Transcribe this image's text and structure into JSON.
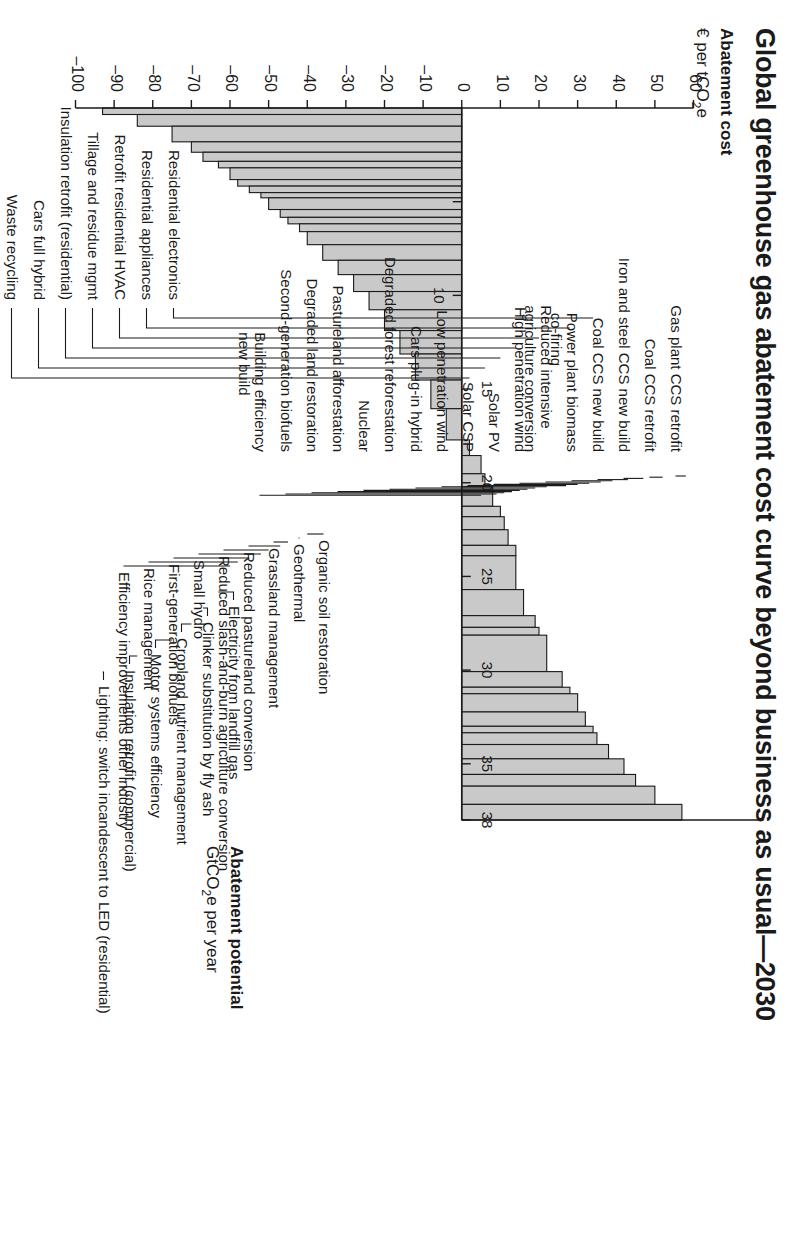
{
  "title": "Global greenhouse gas abatement cost curve beyond business as usual—2030",
  "cost_axis": {
    "label_bold": "Abatement cost",
    "label_unit": "€ per tCO₂e",
    "ticks": [
      60,
      50,
      40,
      30,
      20,
      10,
      0,
      -10,
      -20,
      -30,
      -40,
      -50,
      -60,
      -70,
      -80,
      -90,
      -100
    ]
  },
  "potential_axis": {
    "label_bold": "Abatement potential",
    "label_unit": "GtCO₂e per year",
    "ticks": [
      5,
      10,
      15,
      20,
      25,
      30,
      35,
      38
    ],
    "shown_ticks": [
      10,
      15,
      20,
      25,
      30,
      35,
      38
    ]
  },
  "callouts_positive": [
    "Residential electronics",
    "Residential appliances",
    "Retrofit residential HVAC",
    "Tillage and residue mgmt",
    "Insulation retrofit (residential)",
    "Cars full hybrid",
    "Waste recycling"
  ],
  "callouts_negative": [
    "Electricity from landfill gas",
    "Clinker substitution by fly ash",
    "Cropland nutrient management",
    "Motor systems efficiency",
    "Insulation retrofit (commercial)",
    "Lighting: switch incandescent to LED (residential)"
  ],
  "callouts_upper_left": [
    "Gas plant CCS retrofit",
    "Coal CCS retrofit",
    "Iron and steel CCS new build",
    "Coal CCS new build",
    "Power plant biomass\nco-firing",
    "Reduced intensive\nagriculture conversion",
    "High penetration wind",
    "Solar PV",
    "Solar CSP",
    "Low penetration wind",
    "Cars plug-in hybrid",
    "Degraded forest reforestation",
    "Nuclear",
    "Pastureland afforestation",
    "Degraded land restoration",
    "Second-generation biofuels",
    "Building efficiency\nnew build"
  ],
  "callouts_mid_right": [
    "Organic soil restoration",
    "Geothermal",
    "Grassland management",
    "Reduced pastureland conversion",
    "Reduced slash-and-burn agriculture conversion",
    "Small hydro",
    "First-generation biofuels",
    "Rice management",
    "Efficiency improvements other industry"
  ],
  "colors": {
    "bar_fill": "#c9c9c9",
    "bar_stroke": "#1a1a1a",
    "axis": "#1a1a1a",
    "background": "#ffffff"
  },
  "chart_data": {
    "type": "bar",
    "title": "Global greenhouse gas abatement cost curve beyond business as usual—2030",
    "xlabel": "Abatement potential GtCO2e per year",
    "ylabel": "Abatement cost € per tCO2e",
    "xlim": [
      0,
      38
    ],
    "ylim": [
      -100,
      60
    ],
    "grid": false,
    "legend": null,
    "note": "Marginal abatement cost curve: each bar's WIDTH is abatement potential (GtCO2e/yr) and its HEIGHT is abatement cost (€/tCO2e). Bars are sorted left-to-right from most negative (cheapest) cost to highest cost.",
    "bars": [
      {
        "label": "Lighting: switch incandescent to LED (residential)",
        "width": 0.25,
        "cost": -93
      },
      {
        "label": "Insulation retrofit (commercial)",
        "width": 0.45,
        "cost": -84
      },
      {
        "label": "Motor systems efficiency",
        "width": 0.6,
        "cost": -75
      },
      {
        "label": "Cropland nutrient management",
        "width": 0.4,
        "cost": -70
      },
      {
        "label": "Clinker substitution by fly ash",
        "width": 0.35,
        "cost": -67
      },
      {
        "label": "Electricity from landfill gas",
        "width": 0.25,
        "cost": -63
      },
      {
        "label": "Efficiency improvements other industry",
        "width": 0.45,
        "cost": -60
      },
      {
        "label": "Rice management",
        "width": 0.25,
        "cost": -58
      },
      {
        "label": "First-generation biofuels",
        "width": 0.25,
        "cost": -55
      },
      {
        "label": "Small hydro",
        "width": 0.2,
        "cost": -52
      },
      {
        "label": "Reduced slash-and-burn agriculture conversion",
        "width": 0.45,
        "cost": -50
      },
      {
        "label": "Reduced pastureland conversion",
        "width": 0.3,
        "cost": -47
      },
      {
        "label": "Grassland management",
        "width": 0.25,
        "cost": -45
      },
      {
        "label": "Geothermal",
        "width": 0.3,
        "cost": -42
      },
      {
        "label": "Organic soil restoration",
        "width": 0.5,
        "cost": -40
      },
      {
        "label": "Unlabelled bundle A",
        "width": 0.6,
        "cost": -36
      },
      {
        "label": "Unlabelled bundle B",
        "width": 0.55,
        "cost": -32
      },
      {
        "label": "Unlabelled bundle C",
        "width": 0.65,
        "cost": -28
      },
      {
        "label": "Unlabelled bundle D",
        "width": 0.7,
        "cost": -24
      },
      {
        "label": "Unlabelled bundle E",
        "width": 0.8,
        "cost": -20
      },
      {
        "label": "Unlabelled bundle F",
        "width": 0.9,
        "cost": -16
      },
      {
        "label": "Unlabelled bundle G",
        "width": 1.0,
        "cost": -12
      },
      {
        "label": "Unlabelled bundle H",
        "width": 1.1,
        "cost": -8
      },
      {
        "label": "Unlabelled bundle I",
        "width": 1.2,
        "cost": -4
      },
      {
        "label": "Waste recycling",
        "width": 0.6,
        "cost": 2
      },
      {
        "label": "Cars full hybrid",
        "width": 0.5,
        "cost": 6
      },
      {
        "label": "Insulation retrofit (residential)",
        "width": 0.4,
        "cost": 10
      },
      {
        "label": "Tillage and residue mgmt",
        "width": 0.4,
        "cost": 14
      },
      {
        "label": "Retrofit residential HVAC",
        "width": 0.3,
        "cost": 20
      },
      {
        "label": "Residential appliances",
        "width": 0.25,
        "cost": 28
      },
      {
        "label": "Residential electronics",
        "width": 0.25,
        "cost": 34
      },
      {
        "label": "Building efficiency new build",
        "width": 0.7,
        "cost": 5
      },
      {
        "label": "Second-generation biofuels",
        "width": 0.75,
        "cost": 8
      },
      {
        "label": "Degraded land restoration",
        "width": 0.5,
        "cost": 11
      },
      {
        "label": "Pastureland afforestation",
        "width": 0.6,
        "cost": 12
      },
      {
        "label": "Nuclear",
        "width": 1.3,
        "cost": 14
      },
      {
        "label": "Degraded forest reforestation",
        "width": 1.0,
        "cost": 16
      },
      {
        "label": "Cars plug-in hybrid",
        "width": 0.45,
        "cost": 19
      },
      {
        "label": "Low penetration wind",
        "width": 1.4,
        "cost": 22
      },
      {
        "label": "Solar CSP",
        "width": 0.6,
        "cost": 26
      },
      {
        "label": "Solar PV",
        "width": 0.7,
        "cost": 30
      },
      {
        "label": "High penetration wind",
        "width": 0.55,
        "cost": 32
      },
      {
        "label": "Reduced intensive agriculture conversion",
        "width": 0.45,
        "cost": 35
      },
      {
        "label": "Power plant biomass co-firing",
        "width": 0.55,
        "cost": 38
      },
      {
        "label": "Coal CCS new build",
        "width": 0.6,
        "cost": 42
      },
      {
        "label": "Iron and steel CCS new build",
        "width": 0.45,
        "cost": 45
      },
      {
        "label": "Coal CCS retrofit",
        "width": 0.7,
        "cost": 50
      },
      {
        "label": "Gas plant CCS retrofit",
        "width": 0.6,
        "cost": 57
      }
    ]
  }
}
